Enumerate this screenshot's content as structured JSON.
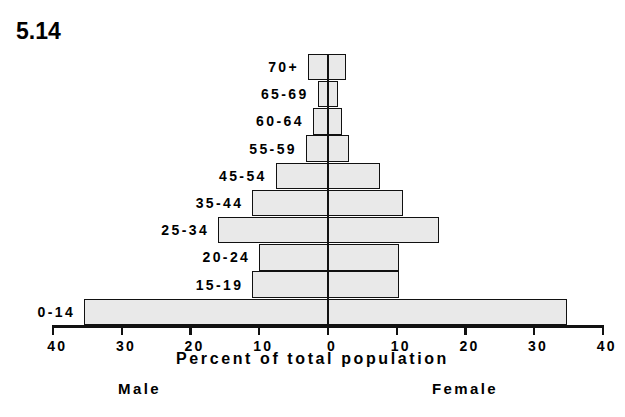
{
  "figure": {
    "number": "5.14"
  },
  "axis": {
    "title": "Percent of total population",
    "tick_labels": [
      "40",
      "30",
      "20",
      "10",
      "0",
      "10",
      "20",
      "30",
      "40"
    ],
    "tick_values": [
      -40,
      -30,
      -20,
      -10,
      0,
      10,
      20,
      30,
      40
    ],
    "left_sex_label": "Male",
    "right_sex_label": "Female",
    "xlim": [
      -40,
      40
    ]
  },
  "chart_data": {
    "type": "bar",
    "title": "5.14",
    "subtitle": "",
    "xlabel": "Percent of total population",
    "ylabel": "",
    "xlim": [
      -40,
      40
    ],
    "grid": false,
    "legend_position": "below-axis",
    "orientation": "horizontal",
    "pyramid": true,
    "categories": [
      "0-14",
      "15-19",
      "20-24",
      "25-34",
      "35-44",
      "45-54",
      "55-59",
      "60-64",
      "65-69",
      "70+"
    ],
    "series": [
      {
        "name": "Male",
        "side": "left",
        "values": [
          35.5,
          11.0,
          10.0,
          16.0,
          11.0,
          7.6,
          3.2,
          2.2,
          1.5,
          2.9
        ]
      },
      {
        "name": "Female",
        "side": "right",
        "values": [
          34.8,
          10.4,
          10.4,
          16.2,
          10.9,
          7.5,
          3.0,
          2.1,
          1.4,
          2.6
        ]
      }
    ],
    "tick_labels": [
      "40",
      "30",
      "20",
      "10",
      "0",
      "10",
      "20",
      "30",
      "40"
    ],
    "annotations": [
      "Male",
      "Female"
    ]
  },
  "rows": [
    {
      "label": "70+",
      "male": 2.9,
      "female": 2.6
    },
    {
      "label": "65-69",
      "male": 1.5,
      "female": 1.4
    },
    {
      "label": "60-64",
      "male": 2.2,
      "female": 2.1
    },
    {
      "label": "55-59",
      "male": 3.2,
      "female": 3.0
    },
    {
      "label": "45-54",
      "male": 7.6,
      "female": 7.5
    },
    {
      "label": "35-44",
      "male": 11.0,
      "female": 10.9
    },
    {
      "label": "25-34",
      "male": 16.0,
      "female": 16.2
    },
    {
      "label": "20-24",
      "male": 10.0,
      "female": 10.4
    },
    {
      "label": "15-19",
      "male": 11.0,
      "female": 10.4
    },
    {
      "label": "0-14",
      "male": 35.5,
      "female": 34.8
    }
  ],
  "colors": {
    "ink": "#111111",
    "bar_fill": "#e9e9e9",
    "bar_stipple": "#4a4a4a",
    "background": "#ffffff"
  }
}
